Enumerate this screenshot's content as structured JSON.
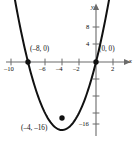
{
  "figure": {
    "title": "",
    "axis_labels": {
      "x": "x",
      "y": "y"
    },
    "colors": {
      "curve": "#111111",
      "axis": "#6b6b6b",
      "point": "#111111",
      "text": "#0d0d0d"
    }
  },
  "annotations": [
    {
      "name": "x-intercept-left",
      "text": "(–8, 0)",
      "x": -8,
      "y": 0
    },
    {
      "name": "origin-point",
      "text": "(0, 0)",
      "x": 0,
      "y": 0
    },
    {
      "name": "vertex-point",
      "text": "(–4, –16)",
      "x": -4,
      "y": -16
    }
  ],
  "ticks": {
    "x_labels": [
      "–10",
      "–6",
      "–4",
      "–2",
      "2"
    ],
    "x_values": [
      -10,
      -6,
      -4,
      -2,
      2
    ],
    "y_labels": [
      "8",
      "4",
      "–16"
    ],
    "y_values": [
      8,
      4,
      -16
    ]
  },
  "chart_data": {
    "type": "line",
    "title": "",
    "xlabel": "x",
    "ylabel": "y",
    "grid": false,
    "legend": "none",
    "xlim": [
      -11,
      3
    ],
    "ylim": [
      -20,
      14
    ],
    "xticks": [
      -10,
      -8,
      -6,
      -4,
      -2,
      0,
      2
    ],
    "xticklabels": [
      "–10",
      "",
      "–6",
      "–4",
      "–2",
      "",
      "2"
    ],
    "yticks": [
      -16,
      -12,
      -8,
      -4,
      4,
      8,
      12
    ],
    "yticklabels": [
      "–16",
      "",
      "",
      "",
      "4",
      "8",
      ""
    ],
    "series": [
      {
        "name": "y = x^2 + 8x",
        "equation": "y = x² + 8x",
        "vertex": [
          -4,
          -16
        ],
        "roots": [
          -8,
          0
        ],
        "x": [
          -10.4,
          -10,
          -9,
          -8,
          -7,
          -6,
          -5,
          -4,
          -3,
          -2,
          -1,
          0,
          1,
          1.6
        ],
        "values": [
          24.96,
          20,
          9,
          0,
          -7,
          -12,
          -15,
          -16,
          -15,
          -12,
          -7,
          0,
          9,
          15.36
        ]
      }
    ],
    "points": [
      {
        "label": "(–8, 0)",
        "x": -8,
        "y": 0
      },
      {
        "label": "(0, 0)",
        "x": 0,
        "y": 0
      },
      {
        "label": "(–4, –16)",
        "x": -4,
        "y": -16
      }
    ]
  }
}
